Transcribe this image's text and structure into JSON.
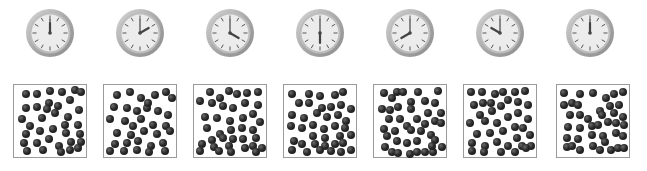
{
  "colors": {
    "background": "#ffffff",
    "clock_rim": "#a9a9a9",
    "clock_face": "#ececec",
    "clock_ticks": "#555555",
    "clock_hand": "#444444",
    "box_border": "#9a9a9a",
    "particle": "#1e1e1e"
  },
  "sequence": [
    {
      "clock": {
        "label": "12:00",
        "hour": 12,
        "minute": 0,
        "cx": 50,
        "cy": 33
      },
      "box": {
        "x": 13,
        "y": 84
      },
      "dots": [
        [
          0.13,
          0.13
        ],
        [
          0.31,
          0.13
        ],
        [
          0.5,
          0.09
        ],
        [
          0.68,
          0.11
        ],
        [
          0.88,
          0.07
        ],
        [
          0.97,
          0.11
        ],
        [
          0.13,
          0.35
        ],
        [
          0.31,
          0.33
        ],
        [
          0.48,
          0.27
        ],
        [
          0.62,
          0.32
        ],
        [
          0.8,
          0.22
        ],
        [
          0.94,
          0.38
        ],
        [
          0.07,
          0.52
        ],
        [
          0.2,
          0.62
        ],
        [
          0.38,
          0.5
        ],
        [
          0.58,
          0.43
        ],
        [
          0.78,
          0.48
        ],
        [
          0.93,
          0.6
        ],
        [
          0.13,
          0.74
        ],
        [
          0.35,
          0.7
        ],
        [
          0.55,
          0.66
        ],
        [
          0.74,
          0.72
        ],
        [
          0.95,
          0.74
        ],
        [
          0.1,
          0.88
        ],
        [
          0.3,
          0.88
        ],
        [
          0.48,
          0.82
        ],
        [
          0.64,
          0.92
        ],
        [
          0.82,
          0.86
        ],
        [
          0.97,
          0.86
        ],
        [
          0.15,
          1.0
        ],
        [
          0.4,
          0.98
        ],
        [
          0.66,
          1.02
        ],
        [
          0.8,
          0.98
        ],
        [
          0.93,
          0.96
        ],
        [
          0.45,
          0.36
        ],
        [
          0.72,
          0.6
        ]
      ]
    },
    {
      "clock": {
        "label": "2:00",
        "hour": 2,
        "minute": 0,
        "cx": 140,
        "cy": 33
      },
      "box": {
        "x": 103,
        "y": 84
      },
      "dots": [
        [
          0.15,
          0.15
        ],
        [
          0.35,
          0.11
        ],
        [
          0.52,
          0.19
        ],
        [
          0.72,
          0.15
        ],
        [
          0.9,
          0.11
        ],
        [
          0.98,
          0.2
        ],
        [
          0.1,
          0.33
        ],
        [
          0.3,
          0.35
        ],
        [
          0.46,
          0.4
        ],
        [
          0.6,
          0.35
        ],
        [
          0.78,
          0.4
        ],
        [
          0.92,
          0.45
        ],
        [
          0.05,
          0.52
        ],
        [
          0.28,
          0.55
        ],
        [
          0.52,
          0.52
        ],
        [
          0.7,
          0.6
        ],
        [
          0.9,
          0.62
        ],
        [
          0.15,
          0.72
        ],
        [
          0.36,
          0.75
        ],
        [
          0.56,
          0.7
        ],
        [
          0.75,
          0.74
        ],
        [
          0.95,
          0.7
        ],
        [
          0.12,
          0.9
        ],
        [
          0.3,
          0.88
        ],
        [
          0.47,
          0.85
        ],
        [
          0.66,
          0.92
        ],
        [
          0.85,
          0.88
        ],
        [
          0.05,
          1.0
        ],
        [
          0.26,
          1.0
        ],
        [
          0.45,
          0.98
        ],
        [
          0.63,
          1.02
        ],
        [
          0.88,
          1.0
        ],
        [
          0.62,
          0.27
        ],
        [
          0.4,
          0.62
        ]
      ]
    },
    {
      "clock": {
        "label": "4:00",
        "hour": 4,
        "minute": 0,
        "cx": 230,
        "cy": 33
      },
      "box": {
        "x": 193,
        "y": 84
      },
      "dots": [
        [
          0.2,
          0.1
        ],
        [
          0.35,
          0.2
        ],
        [
          0.48,
          0.09
        ],
        [
          0.6,
          0.14
        ],
        [
          0.75,
          0.12
        ],
        [
          0.92,
          0.1
        ],
        [
          0.05,
          0.24
        ],
        [
          0.22,
          0.27
        ],
        [
          0.4,
          0.32
        ],
        [
          0.55,
          0.35
        ],
        [
          0.72,
          0.28
        ],
        [
          0.92,
          0.3
        ],
        [
          0.12,
          0.48
        ],
        [
          0.3,
          0.5
        ],
        [
          0.5,
          0.55
        ],
        [
          0.7,
          0.5
        ],
        [
          0.85,
          0.44
        ],
        [
          0.95,
          0.56
        ],
        [
          0.15,
          0.65
        ],
        [
          0.35,
          0.74
        ],
        [
          0.52,
          0.68
        ],
        [
          0.68,
          0.65
        ],
        [
          0.85,
          0.68
        ],
        [
          0.22,
          0.84
        ],
        [
          0.4,
          0.8
        ],
        [
          0.55,
          0.82
        ],
        [
          0.7,
          0.82
        ],
        [
          0.9,
          0.8
        ],
        [
          0.08,
          0.9
        ],
        [
          0.25,
          0.94
        ],
        [
          0.48,
          0.92
        ],
        [
          0.72,
          0.95
        ],
        [
          0.85,
          0.92
        ],
        [
          0.05,
          1.0
        ],
        [
          0.33,
          1.0
        ],
        [
          0.52,
          1.02
        ],
        [
          0.9,
          1.02
        ],
        [
          0.98,
          0.96
        ]
      ]
    },
    {
      "clock": {
        "label": "6:00",
        "hour": 6,
        "minute": 0,
        "cx": 320,
        "cy": 33
      },
      "box": {
        "x": 283,
        "y": 84
      },
      "dots": [
        [
          0.07,
          0.13
        ],
        [
          0.33,
          0.13
        ],
        [
          0.5,
          0.16
        ],
        [
          0.72,
          0.15
        ],
        [
          0.85,
          0.1
        ],
        [
          0.18,
          0.28
        ],
        [
          0.33,
          0.27
        ],
        [
          0.53,
          0.35
        ],
        [
          0.66,
          0.33
        ],
        [
          0.82,
          0.3
        ],
        [
          0.97,
          0.37
        ],
        [
          0.08,
          0.45
        ],
        [
          0.25,
          0.5
        ],
        [
          0.45,
          0.42
        ],
        [
          0.6,
          0.48
        ],
        [
          0.78,
          0.45
        ],
        [
          0.9,
          0.55
        ],
        [
          0.06,
          0.62
        ],
        [
          0.22,
          0.65
        ],
        [
          0.4,
          0.6
        ],
        [
          0.56,
          0.66
        ],
        [
          0.72,
          0.62
        ],
        [
          0.88,
          0.65
        ],
        [
          0.4,
          0.77
        ],
        [
          0.58,
          0.8
        ],
        [
          0.8,
          0.78
        ],
        [
          0.97,
          0.75
        ],
        [
          0.1,
          0.85
        ],
        [
          0.22,
          0.9
        ],
        [
          0.42,
          0.9
        ],
        [
          0.58,
          0.92
        ],
        [
          0.72,
          0.9
        ],
        [
          0.85,
          0.88
        ],
        [
          0.08,
          0.98
        ],
        [
          0.3,
          1.02
        ],
        [
          0.5,
          0.98
        ],
        [
          0.66,
          1.0
        ],
        [
          0.82,
          1.02
        ],
        [
          0.97,
          0.98
        ]
      ]
    },
    {
      "clock": {
        "label": "8:00",
        "hour": 8,
        "minute": 0,
        "cx": 410,
        "cy": 33
      },
      "box": {
        "x": 373,
        "y": 84
      },
      "dots": [
        [
          0.1,
          0.12
        ],
        [
          0.3,
          0.1
        ],
        [
          0.4,
          0.1
        ],
        [
          0.62,
          0.1
        ],
        [
          0.92,
          0.09
        ],
        [
          0.22,
          0.2
        ],
        [
          0.52,
          0.25
        ],
        [
          0.72,
          0.24
        ],
        [
          0.88,
          0.28
        ],
        [
          0.08,
          0.36
        ],
        [
          0.2,
          0.38
        ],
        [
          0.32,
          0.34
        ],
        [
          0.52,
          0.37
        ],
        [
          0.78,
          0.43
        ],
        [
          0.97,
          0.43
        ],
        [
          0.18,
          0.52
        ],
        [
          0.35,
          0.52
        ],
        [
          0.6,
          0.52
        ],
        [
          0.72,
          0.59
        ],
        [
          0.88,
          0.54
        ],
        [
          0.97,
          0.58
        ],
        [
          0.1,
          0.67
        ],
        [
          0.28,
          0.7
        ],
        [
          0.45,
          0.62
        ],
        [
          0.52,
          0.68
        ],
        [
          0.66,
          0.7
        ],
        [
          0.82,
          0.76
        ],
        [
          0.15,
          0.78
        ],
        [
          0.3,
          0.85
        ],
        [
          0.45,
          0.88
        ],
        [
          0.6,
          0.85
        ],
        [
          0.88,
          0.83
        ],
        [
          0.12,
          0.94
        ],
        [
          0.98,
          0.94
        ],
        [
          0.22,
          1.02
        ],
        [
          0.32,
          1.03
        ],
        [
          0.5,
          1.05
        ],
        [
          0.6,
          1.02
        ],
        [
          0.72,
          1.02
        ],
        [
          0.85,
          1.02
        ],
        [
          0.83,
          0.92
        ]
      ]
    },
    {
      "clock": {
        "label": "10:00",
        "hour": 10,
        "minute": 0,
        "cx": 500,
        "cy": 33
      },
      "box": {
        "x": 463,
        "y": 84
      },
      "dots": [
        [
          0.06,
          0.11
        ],
        [
          0.22,
          0.1
        ],
        [
          0.42,
          0.14
        ],
        [
          0.55,
          0.1
        ],
        [
          0.72,
          0.1
        ],
        [
          0.88,
          0.09
        ],
        [
          0.1,
          0.3
        ],
        [
          0.24,
          0.28
        ],
        [
          0.37,
          0.28
        ],
        [
          0.52,
          0.32
        ],
        [
          0.62,
          0.22
        ],
        [
          0.78,
          0.26
        ],
        [
          0.92,
          0.3
        ],
        [
          0.2,
          0.45
        ],
        [
          0.38,
          0.4
        ],
        [
          0.62,
          0.48
        ],
        [
          0.78,
          0.42
        ],
        [
          0.92,
          0.52
        ],
        [
          0.05,
          0.58
        ],
        [
          0.28,
          0.54
        ],
        [
          0.45,
          0.58
        ],
        [
          0.72,
          0.64
        ],
        [
          0.85,
          0.65
        ],
        [
          0.15,
          0.74
        ],
        [
          0.35,
          0.72
        ],
        [
          0.55,
          0.7
        ],
        [
          0.75,
          0.8
        ],
        [
          0.95,
          0.76
        ],
        [
          0.08,
          0.88
        ],
        [
          0.28,
          0.92
        ],
        [
          0.45,
          0.86
        ],
        [
          0.62,
          0.92
        ],
        [
          0.84,
          0.92
        ],
        [
          0.97,
          0.92
        ],
        [
          0.08,
          1.0
        ],
        [
          0.26,
          1.02
        ],
        [
          0.52,
          1.02
        ],
        [
          0.72,
          1.02
        ],
        [
          0.9,
          0.96
        ]
      ]
    },
    {
      "clock": {
        "label": "12:00",
        "hour": 12,
        "minute": 0,
        "cx": 590,
        "cy": 33
      },
      "box": {
        "x": 556,
        "y": 84
      },
      "dots": [
        [
          0.06,
          0.12
        ],
        [
          0.3,
          0.13
        ],
        [
          0.5,
          0.12
        ],
        [
          0.7,
          0.19
        ],
        [
          0.82,
          0.14
        ],
        [
          0.95,
          0.1
        ],
        [
          0.06,
          0.3
        ],
        [
          0.18,
          0.28
        ],
        [
          0.28,
          0.3
        ],
        [
          0.6,
          0.39
        ],
        [
          0.75,
          0.32
        ],
        [
          0.9,
          0.3
        ],
        [
          0.15,
          0.45
        ],
        [
          0.3,
          0.45
        ],
        [
          0.42,
          0.52
        ],
        [
          0.64,
          0.45
        ],
        [
          0.82,
          0.42
        ],
        [
          0.95,
          0.48
        ],
        [
          0.12,
          0.64
        ],
        [
          0.3,
          0.65
        ],
        [
          0.48,
          0.62
        ],
        [
          0.58,
          0.6
        ],
        [
          0.72,
          0.56
        ],
        [
          0.85,
          0.58
        ],
        [
          0.97,
          0.6
        ],
        [
          0.1,
          0.8
        ],
        [
          0.28,
          0.82
        ],
        [
          0.48,
          0.76
        ],
        [
          0.65,
          0.78
        ],
        [
          0.85,
          0.72
        ],
        [
          0.95,
          0.78
        ],
        [
          0.1,
          0.94
        ],
        [
          0.18,
          0.92
        ],
        [
          0.3,
          0.98
        ],
        [
          0.5,
          0.92
        ],
        [
          0.68,
          0.86
        ],
        [
          0.78,
          0.98
        ],
        [
          0.88,
          0.96
        ],
        [
          0.97,
          0.96
        ],
        [
          0.6,
          0.98
        ]
      ]
    }
  ]
}
